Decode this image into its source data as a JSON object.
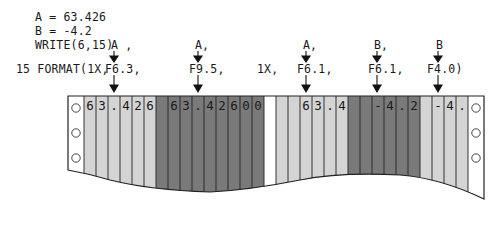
{
  "code": {
    "line1": "A = 63.426",
    "line2": "B = -4.2",
    "line3": "WRITE(6,15)",
    "format_prefix": "15 FORMAT(1X,"
  },
  "write_args": [
    {
      "label": "A ,",
      "x": 111
    },
    {
      "label": "A,",
      "x": 195
    },
    {
      "label": "A,",
      "x": 303
    },
    {
      "label": "B,",
      "x": 375
    },
    {
      "label": "B",
      "x": 437
    }
  ],
  "format_specs": [
    {
      "label": "F6.3,",
      "x": 105
    },
    {
      "label": "F9.5,",
      "x": 189
    },
    {
      "label": "1X,",
      "x": 257
    },
    {
      "label": "F6.1,",
      "x": 297
    },
    {
      "label": "F6.1,",
      "x": 368
    },
    {
      "label": "F4.0)",
      "x": 427
    }
  ],
  "output_fields": [
    {
      "spec": "F6.3",
      "shade": "light",
      "chars": [
        "6",
        "3",
        ".",
        "4",
        "2",
        "6"
      ]
    },
    {
      "spec": "F9.5",
      "shade": "dark",
      "chars": [
        " ",
        "6",
        "3",
        ".",
        "4",
        "2",
        "6",
        "0",
        "0"
      ]
    },
    {
      "spec": "1X",
      "shade": "white",
      "chars": [
        " "
      ]
    },
    {
      "spec": "F6.1",
      "shade": "light",
      "chars": [
        " ",
        " ",
        "6",
        "3",
        ".",
        "4"
      ]
    },
    {
      "spec": "F6.1",
      "shade": "dark",
      "chars": [
        " ",
        " ",
        "-",
        "4",
        ".",
        "2"
      ]
    },
    {
      "spec": "F4.0",
      "shade": "light",
      "chars": [
        " ",
        "-",
        "4",
        "."
      ]
    }
  ],
  "colors": {
    "light": "#d4d4d4",
    "dark": "#7a7a7a",
    "white": "#ffffff",
    "line": "#222222"
  }
}
